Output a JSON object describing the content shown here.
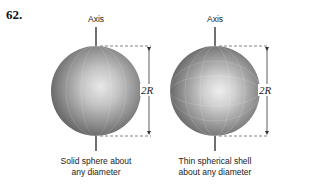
{
  "problem_number": "62.",
  "figures": [
    {
      "axis_label": "Axis",
      "dimension_label": "2R",
      "caption_line1": "Solid sphere about",
      "caption_line2": "any diameter"
    },
    {
      "axis_label": "Axis",
      "dimension_label": "2R",
      "caption_line1": "Thin spherical shell",
      "caption_line2": "about any diameter"
    }
  ],
  "colors": {
    "sphere_light": "#e6e6e6",
    "sphere_dark": "#5a5a5a",
    "line": "#222222",
    "dashed": "#777777"
  }
}
